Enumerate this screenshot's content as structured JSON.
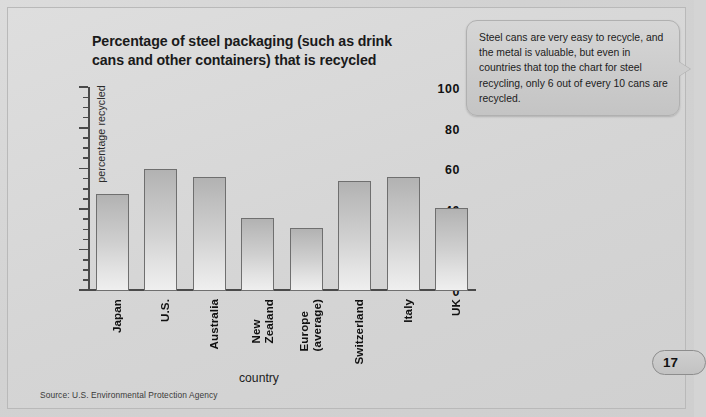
{
  "page": {
    "number": "17",
    "source_note": "Source: U.S. Environmental Protection Agency"
  },
  "callout": {
    "text": "Steel cans are very easy to recycle, and the metal is valuable, but even in countries that top the chart for steel recycling, only 6 out of every 10 cans are recycled."
  },
  "title_lines": {
    "line1": "Percentage of steel packaging (such as drink",
    "line2": "cans and other containers) that is recycled"
  },
  "colors": {
    "page_background": "#d5d5d5",
    "bar_top": "#b2b2b2",
    "bar_bottom": "#efefef",
    "bar_border": "#6f6f6f",
    "axis": "#4a4a4a",
    "callout_background": "#cdcdcd",
    "text": "#111111"
  },
  "chart_data": {
    "type": "bar",
    "title": "Percentage of steel packaging (such as drink cans and other containers) that is recycled",
    "xlabel": "country",
    "ylabel": "percentage recycled",
    "ylim": [
      0,
      100
    ],
    "ytick_labels": [
      "0",
      "20",
      "40",
      "60",
      "80",
      "100"
    ],
    "ytick_values": [
      0,
      20,
      40,
      60,
      80,
      100
    ],
    "minor_tick_step": 5,
    "grid": false,
    "legend": false,
    "categories": [
      "Japan",
      "U.S.",
      "Australia",
      "New Zealand",
      "Europe (average)",
      "Switzerland",
      "Italy",
      "UK"
    ],
    "category_label_lines": [
      [
        "Japan"
      ],
      [
        "U.S."
      ],
      [
        "Australia"
      ],
      [
        "New",
        "Zealand"
      ],
      [
        "Europe",
        "(average)"
      ],
      [
        "Switzerland"
      ],
      [
        "Italy"
      ],
      [
        "UK"
      ]
    ],
    "values": [
      48,
      60,
      56,
      36,
      31,
      54,
      56,
      41
    ],
    "source": "U.S. Environmental Protection Agency"
  }
}
